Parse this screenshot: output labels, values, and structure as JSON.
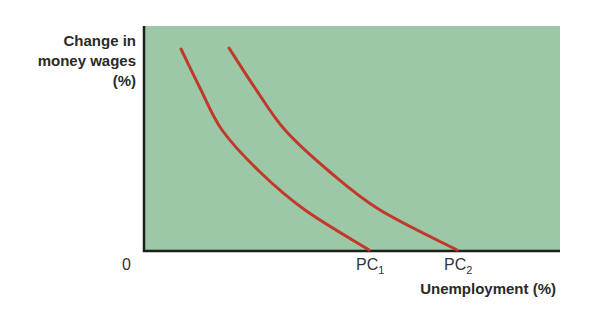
{
  "chart_data": {
    "type": "line",
    "title": "",
    "ylabel_lines": [
      "Change in",
      "money wages",
      "(%)"
    ],
    "xlabel": "Unemployment (%)",
    "origin_label": "0",
    "background_color": "#9cc8a8",
    "line_color": "#c0392b",
    "grid": false,
    "series": [
      {
        "name": "PC1",
        "label_base": "PC",
        "label_sub": "1",
        "points_px": [
          [
            181,
            49
          ],
          [
            200,
            88
          ],
          [
            222,
            130
          ],
          [
            260,
            172
          ],
          [
            305,
            210
          ],
          [
            369,
            250
          ]
        ]
      },
      {
        "name": "PC2",
        "label_base": "PC",
        "label_sub": "2",
        "points_px": [
          [
            229,
            48
          ],
          [
            255,
            88
          ],
          [
            285,
            130
          ],
          [
            330,
            172
          ],
          [
            380,
            210
          ],
          [
            457,
            250
          ]
        ]
      }
    ]
  }
}
